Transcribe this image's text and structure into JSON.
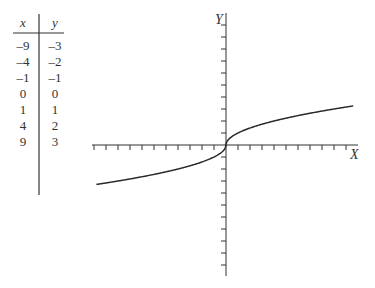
{
  "table": {
    "headers": [
      "x",
      "y"
    ],
    "rows": [
      {
        "x": "–9",
        "y": "–3"
      },
      {
        "x": "–4",
        "y": "–2"
      },
      {
        "x": "–1",
        "y": "–1"
      },
      {
        "x": "0",
        "y": "0"
      },
      {
        "x": "1",
        "y": "1"
      },
      {
        "x": "4",
        "y": "2"
      },
      {
        "x": "9",
        "y": "3"
      }
    ]
  },
  "graph": {
    "x_axis_label": "X",
    "y_axis_label": "Y",
    "function": "y = sign(x)·√|x|",
    "x_ticks_left": 11,
    "x_ticks_right": 10,
    "y_ticks_up": 10,
    "y_ticks_down": 10,
    "unit_px": 12,
    "curve_domain": [
      -10.8,
      10.6
    ],
    "line_color": "#2a2a2a"
  }
}
